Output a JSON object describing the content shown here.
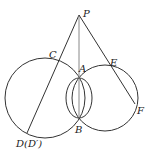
{
  "diagram": {
    "points": {
      "P": {
        "label": "P",
        "x": 79,
        "y": 15
      },
      "C": {
        "label": "C",
        "x": 58,
        "y": 59
      },
      "A": {
        "label": "A",
        "x": 79,
        "y": 78
      },
      "E": {
        "label": "E",
        "x": 111,
        "y": 66
      },
      "F": {
        "label": "F",
        "x": 135,
        "y": 105
      },
      "B": {
        "label": "B",
        "x": 79,
        "y": 118
      },
      "D": {
        "label": "D(D′)",
        "x": 27,
        "y": 131
      }
    },
    "circles": [
      {
        "name": "left-circle",
        "cx": 45,
        "cy": 98,
        "r": 40
      },
      {
        "name": "right-circle",
        "cx": 105,
        "cy": 98,
        "r": 33
      },
      {
        "name": "small-ellipse",
        "cx": 79,
        "cy": 98,
        "rx": 13,
        "ry": 21
      }
    ],
    "segments": [
      {
        "name": "PD",
        "from": "P",
        "to": "D"
      },
      {
        "name": "PB",
        "from": "P",
        "to": "B"
      },
      {
        "name": "PF",
        "from": "P",
        "to": "F"
      }
    ],
    "colors": {
      "stroke": "#333333",
      "line_pb": "#888888"
    }
  }
}
